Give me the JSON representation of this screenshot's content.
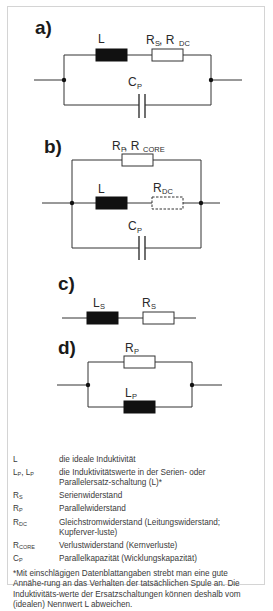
{
  "panels": [
    {
      "id": "a",
      "label": "a)",
      "components": {
        "inductor": "L",
        "resistor_main": "R",
        "resistor_sub1": "S",
        "resistor_sep": ", R",
        "resistor_sub2": "DC",
        "capacitor": "C",
        "capacitor_sub": "P"
      }
    },
    {
      "id": "b",
      "label": "b)",
      "components": {
        "resistor_top": "R",
        "resistor_top_sub1": "P",
        "resistor_top_sep": ", R",
        "resistor_top_sub2": "CORE",
        "inductor": "L",
        "resistor_dc": "R",
        "resistor_dc_sub": "DC",
        "capacitor": "C",
        "capacitor_sub": "P"
      }
    },
    {
      "id": "c",
      "label": "c)",
      "components": {
        "inductor": "L",
        "inductor_sub": "S",
        "resistor": "R",
        "resistor_sub": "S"
      }
    },
    {
      "id": "d",
      "label": "d)",
      "components": {
        "resistor": "R",
        "resistor_sub": "P",
        "inductor": "L",
        "inductor_sub": "P"
      }
    }
  ],
  "legend": [
    {
      "sym": "L",
      "sub": "",
      "sym2": "",
      "sub2": "",
      "desc": "die ideale Induktivität"
    },
    {
      "sym": "L",
      "sub": "P",
      "sym2": ", L",
      "sub2": "P",
      "desc": "die Induktivitätswerte in der Serien- oder Parallelersatz-schaltung (L)*"
    },
    {
      "sym": "R",
      "sub": "S",
      "sym2": "",
      "sub2": "",
      "desc": "Serienwiderstand"
    },
    {
      "sym": "R",
      "sub": "P",
      "sym2": "",
      "sub2": "",
      "desc": "Parallelwiderstand"
    },
    {
      "sym": "R",
      "sub": "DC",
      "sym2": "",
      "sub2": "",
      "desc": "Gleichstromwiderstand (Leitungswiderstand; Kupferver-luste)"
    },
    {
      "sym": "R",
      "sub": "CORE",
      "sym2": "",
      "sub2": "",
      "desc": "Verlustwiderstand (Kernverluste)"
    },
    {
      "sym": "C",
      "sub": "P",
      "sym2": "",
      "sub2": "",
      "desc": "Parallelkapazität (Wicklungskapazität)"
    }
  ],
  "note": "*Mit einschlägigen Datenblattangaben strebt man eine gute Annähe-rung an das Verhalten der tatsächlichen Spule an. Die Induktivitäts-werte der Ersatzschaltungen können deshalb vom (idealen) Nennwert L abweichen."
}
